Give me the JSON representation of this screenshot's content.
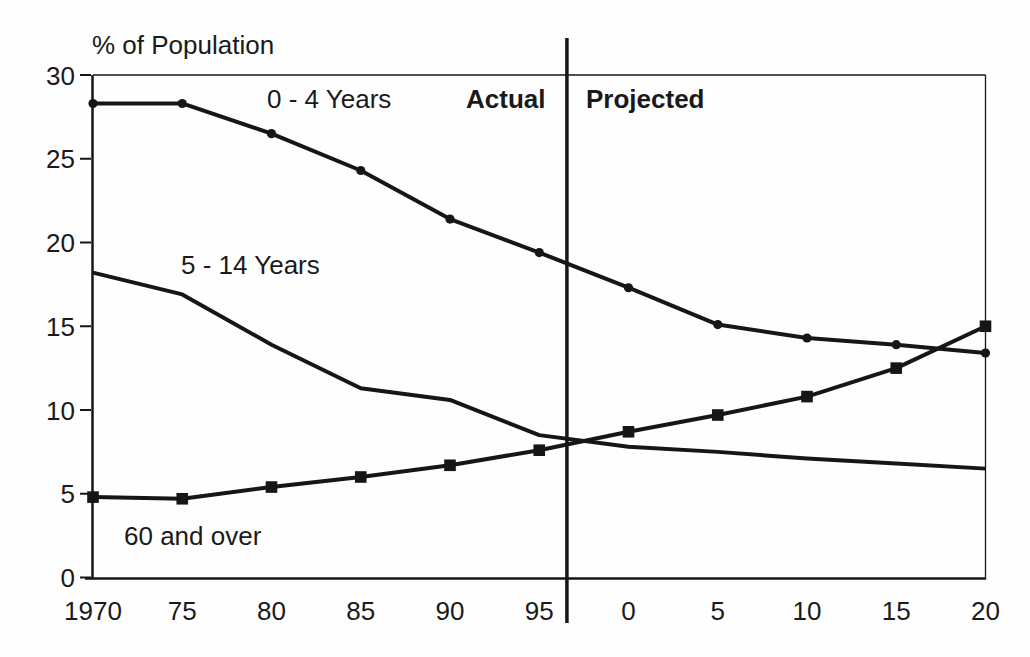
{
  "colors": {
    "ink": "#161616",
    "background": "#fefefe"
  },
  "chart_data": {
    "type": "line",
    "title": "",
    "xlabel": "",
    "ylabel": "% of Population",
    "ylim": [
      0,
      30
    ],
    "grid": false,
    "legend_position": "inline-annotations",
    "x_tick_labels": [
      "1970",
      "75",
      "80",
      "85",
      "90",
      "95",
      "0",
      "5",
      "10",
      "15",
      "20"
    ],
    "y_ticks": [
      0,
      5,
      10,
      15,
      20,
      25,
      30
    ],
    "series": [
      {
        "name": "0 - 4 Years",
        "marker": "circle",
        "values": [
          28.3,
          28.3,
          26.5,
          24.3,
          21.4,
          19.4,
          17.3,
          15.1,
          14.3,
          13.9,
          13.4
        ]
      },
      {
        "name": "5 - 14 Years",
        "marker": "none",
        "values": [
          18.2,
          16.9,
          13.9,
          11.3,
          10.6,
          8.5,
          7.8,
          7.5,
          7.1,
          6.8,
          6.5
        ]
      },
      {
        "name": "60 and over",
        "marker": "square",
        "values": [
          4.8,
          4.7,
          5.4,
          6.0,
          6.7,
          7.6,
          8.7,
          9.7,
          10.8,
          12.5,
          15.0
        ]
      }
    ],
    "divider": {
      "left_label": "Actual",
      "right_label": "Projected",
      "between_ticks": [
        "95",
        "0"
      ],
      "fraction_after_index": 0.31,
      "after_index": 5
    }
  }
}
